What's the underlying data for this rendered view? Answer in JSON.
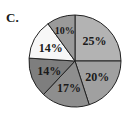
{
  "panel_label": "C.",
  "chart_data": {
    "type": "pie",
    "title": "",
    "start_angle": "top (12 o'clock), clockwise",
    "slices": [
      {
        "label": "25%",
        "value": 25,
        "color": "#b3b3b3"
      },
      {
        "label": "20%",
        "value": 20,
        "color": "#a0a0a0"
      },
      {
        "label": "17%",
        "value": 17,
        "color": "#8e8e8e"
      },
      {
        "label": "14%",
        "value": 14,
        "color": "#7e7e7e"
      },
      {
        "label": "14%",
        "value": 14,
        "color": "#f7f7f7"
      },
      {
        "label": "10%",
        "value": 10,
        "color": "#9a9a9a"
      }
    ]
  }
}
